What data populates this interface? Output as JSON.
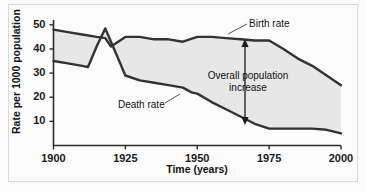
{
  "chart_data": {
    "type": "line",
    "title": "",
    "xlabel": "Time (years)",
    "ylabel": "Rate per 1000 population",
    "xlim": [
      1900,
      2000
    ],
    "ylim": [
      0,
      52
    ],
    "xticks": [
      1900,
      1925,
      1950,
      1975,
      2000
    ],
    "yticks": [
      10,
      20,
      30,
      40,
      50
    ],
    "grid": false,
    "legend_position": "inline-annotations",
    "fill_between_series": [
      "Birth rate",
      "Death rate"
    ],
    "fill_color": "#e7e7e7",
    "line_color": "#333333",
    "series": [
      {
        "name": "Birth rate",
        "x": [
          1900,
          1905,
          1910,
          1915,
          1918,
          1920,
          1925,
          1930,
          1935,
          1940,
          1945,
          1950,
          1955,
          1960,
          1965,
          1970,
          1975,
          1980,
          1985,
          1990,
          1995,
          2000
        ],
        "values": [
          48,
          47,
          46,
          45,
          44.5,
          41,
          45,
          45,
          44,
          44,
          43,
          45,
          45,
          44.5,
          44,
          43.5,
          43.5,
          40,
          36,
          33,
          29,
          25
        ]
      },
      {
        "name": "Death rate",
        "x": [
          1900,
          1905,
          1910,
          1912,
          1915,
          1918,
          1920,
          1925,
          1930,
          1935,
          1940,
          1945,
          1948,
          1950,
          1955,
          1960,
          1965,
          1970,
          1975,
          1980,
          1985,
          1990,
          1995,
          2000
        ],
        "values": [
          35,
          34,
          33,
          32.5,
          41,
          48.5,
          43,
          29,
          27,
          26,
          25,
          24,
          22,
          21.5,
          18,
          15,
          12,
          9,
          7,
          7,
          7,
          7,
          6.5,
          5
        ]
      }
    ],
    "annotations": [
      {
        "id": "birth-rate",
        "text": "Birth rate",
        "target_series": "Birth rate"
      },
      {
        "id": "death-rate",
        "text": "Death rate",
        "target_series": "Death rate"
      },
      {
        "id": "overall-increase",
        "text": "Overall population increase",
        "arrow": "double-headed-vertical",
        "at_year": 1968,
        "from_value": 9,
        "to_value": 43.5
      }
    ]
  },
  "axes": {
    "y_title": "Rate per 1000 population",
    "x_title": "Time (years)",
    "y_tick_labels": [
      "50",
      "40",
      "30",
      "20",
      "10"
    ],
    "x_tick_labels": [
      "1900",
      "1925",
      "1950",
      "1975",
      "2000"
    ]
  },
  "annotations": {
    "birth_rate": "Birth rate",
    "death_rate": "Death rate",
    "overall_line1": "Overall population",
    "overall_line2": "increase"
  },
  "colors": {
    "line": "#333333",
    "fill": "#e7e7e7",
    "axis": "#2b2b2b",
    "text": "#111111",
    "background": "#fcfcfc"
  }
}
